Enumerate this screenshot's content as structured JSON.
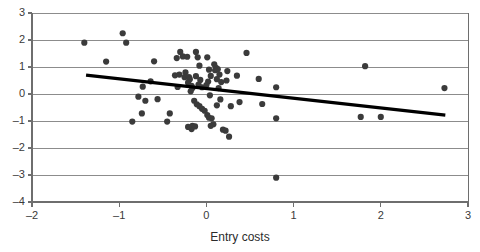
{
  "chart_data": {
    "type": "scatter",
    "title": "",
    "xlabel": "Entry costs",
    "ylabel": "",
    "xlim": [
      -2,
      3
    ],
    "ylim": [
      -4,
      3
    ],
    "xticks": [
      -2,
      -1,
      0,
      1,
      2,
      3
    ],
    "yticks": [
      -4,
      -3,
      -2,
      -1,
      0,
      1,
      2,
      3
    ],
    "xtick_labels": [
      "–2",
      "–1",
      "0",
      "1",
      "2",
      "3"
    ],
    "ytick_labels": [
      "–4",
      "–3",
      "–2",
      "–1",
      "0",
      "1",
      "2",
      "3"
    ],
    "grid": "horizontal",
    "grid_color": "#8c8c8c",
    "axis_color": "#6e6e6e",
    "marker_color": "#3b3b3b",
    "marker_size": 3.1,
    "legend": "none",
    "series": [
      {
        "name": "observations",
        "type": "scatter",
        "points": [
          [
            -1.4,
            1.9
          ],
          [
            -0.96,
            2.25
          ],
          [
            -0.92,
            1.9
          ],
          [
            -1.15,
            1.2
          ],
          [
            -0.6,
            1.21
          ],
          [
            -0.73,
            0.27
          ],
          [
            -0.78,
            -0.1
          ],
          [
            -0.7,
            -0.25
          ],
          [
            -0.56,
            -0.19
          ],
          [
            -0.74,
            -0.72
          ],
          [
            -0.85,
            -1.02
          ],
          [
            -0.64,
            0.47
          ],
          [
            -0.42,
            -0.72
          ],
          [
            -0.45,
            -1.02
          ],
          [
            -0.34,
            1.33
          ],
          [
            -0.3,
            1.56
          ],
          [
            -0.36,
            0.69
          ],
          [
            -0.31,
            0.72
          ],
          [
            -0.33,
            0.26
          ],
          [
            -0.27,
            1.39
          ],
          [
            -0.22,
            1.38
          ],
          [
            -0.24,
            0.8
          ],
          [
            -0.25,
            0.62
          ],
          [
            -0.2,
            0.63
          ],
          [
            -0.19,
            0.55
          ],
          [
            -0.21,
            0.42
          ],
          [
            -0.17,
            0.3
          ],
          [
            -0.16,
            0.22
          ],
          [
            -0.18,
            0.1
          ],
          [
            -0.12,
            1.56
          ],
          [
            -0.1,
            1.36
          ],
          [
            -0.08,
            1.05
          ],
          [
            -0.12,
            0.66
          ],
          [
            -0.07,
            0.52
          ],
          [
            -0.09,
            0.35
          ],
          [
            -0.05,
            0.25
          ],
          [
            -0.14,
            -0.25
          ],
          [
            -0.11,
            -0.38
          ],
          [
            -0.08,
            -0.45
          ],
          [
            -0.16,
            -1.18
          ],
          [
            -0.17,
            -1.3
          ],
          [
            -0.21,
            -1.22
          ],
          [
            -0.13,
            -1.2
          ],
          [
            -0.05,
            -0.55
          ],
          [
            -0.02,
            -0.62
          ],
          [
            0.01,
            1.36
          ],
          [
            0.03,
            0.9
          ],
          [
            0.05,
            0.67
          ],
          [
            0.02,
            0.46
          ],
          [
            0.0,
            0.33
          ],
          [
            0.04,
            -0.05
          ],
          [
            0.01,
            -0.78
          ],
          [
            0.03,
            -0.88
          ],
          [
            0.06,
            -0.9
          ],
          [
            0.08,
            -1.12
          ],
          [
            0.05,
            -1.18
          ],
          [
            0.09,
            1.1
          ],
          [
            0.11,
            0.97
          ],
          [
            0.13,
            0.92
          ],
          [
            0.1,
            0.88
          ],
          [
            0.15,
            0.72
          ],
          [
            0.12,
            0.55
          ],
          [
            0.17,
            0.44
          ],
          [
            0.14,
            0.22
          ],
          [
            0.16,
            -0.2
          ],
          [
            0.12,
            -0.42
          ],
          [
            0.19,
            -1.32
          ],
          [
            0.22,
            -1.36
          ],
          [
            0.26,
            -1.58
          ],
          [
            0.24,
            0.85
          ],
          [
            0.23,
            0.5
          ],
          [
            0.28,
            -0.45
          ],
          [
            0.35,
            0.68
          ],
          [
            0.38,
            -0.3
          ],
          [
            0.46,
            1.52
          ],
          [
            0.6,
            0.56
          ],
          [
            0.64,
            -0.37
          ],
          [
            0.8,
            0.25
          ],
          [
            0.8,
            -0.9
          ],
          [
            0.8,
            -3.1
          ],
          [
            1.82,
            1.03
          ],
          [
            1.77,
            -0.85
          ],
          [
            2.0,
            -0.85
          ],
          [
            2.73,
            0.22
          ]
        ]
      },
      {
        "name": "trend-line",
        "type": "line",
        "points": [
          [
            -1.38,
            0.7
          ],
          [
            2.74,
            -0.78
          ]
        ],
        "color": "#000000",
        "width": 3.2
      }
    ]
  },
  "axes": {
    "x_title": "Entry costs"
  }
}
